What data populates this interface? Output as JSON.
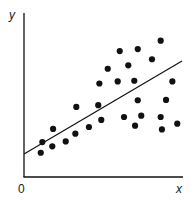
{
  "chart_data": {
    "type": "scatter",
    "title": "",
    "xlabel": "x",
    "ylabel": "y",
    "origin_label": "0",
    "xlim": [
      0,
      10
    ],
    "ylim": [
      0,
      10
    ],
    "grid": false,
    "legend": null,
    "series": [
      {
        "name": "observations",
        "color": "#111111",
        "points": [
          {
            "x": 1.06,
            "y": 1.48
          },
          {
            "x": 1.16,
            "y": 2.13
          },
          {
            "x": 1.79,
            "y": 1.87
          },
          {
            "x": 1.84,
            "y": 2.93
          },
          {
            "x": 2.64,
            "y": 2.17
          },
          {
            "x": 3.25,
            "y": 2.64
          },
          {
            "x": 3.31,
            "y": 4.27
          },
          {
            "x": 4.11,
            "y": 3.05
          },
          {
            "x": 4.7,
            "y": 4.38
          },
          {
            "x": 4.77,
            "y": 5.7
          },
          {
            "x": 4.89,
            "y": 3.48
          },
          {
            "x": 5.3,
            "y": 6.6
          },
          {
            "x": 5.93,
            "y": 5.83
          },
          {
            "x": 6.06,
            "y": 7.68
          },
          {
            "x": 6.33,
            "y": 3.66
          },
          {
            "x": 6.6,
            "y": 6.81
          },
          {
            "x": 6.98,
            "y": 5.87
          },
          {
            "x": 7.03,
            "y": 3.13
          },
          {
            "x": 7.2,
            "y": 7.8
          },
          {
            "x": 7.2,
            "y": 4.68
          },
          {
            "x": 7.42,
            "y": 3.74
          },
          {
            "x": 8.1,
            "y": 7.18
          },
          {
            "x": 8.65,
            "y": 8.31
          },
          {
            "x": 8.65,
            "y": 3.66
          },
          {
            "x": 8.73,
            "y": 2.9
          },
          {
            "x": 8.99,
            "y": 4.7
          },
          {
            "x": 9.39,
            "y": 5.83
          },
          {
            "x": 9.7,
            "y": 3.25
          }
        ]
      }
    ],
    "trend_line": {
      "name": "line of best fit",
      "x": [
        0,
        10
      ],
      "y": [
        1.4,
        7.07
      ],
      "color": "#111111"
    }
  }
}
